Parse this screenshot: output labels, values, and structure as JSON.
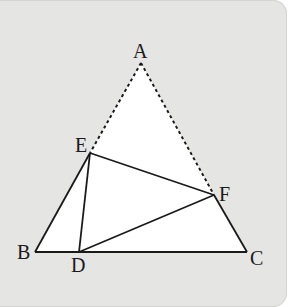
{
  "figure": {
    "type": "geometry-diagram",
    "colors": {
      "panel_bg": "#e5e5e3",
      "line": "#1a1a1a",
      "fill": "#ffffff"
    },
    "points": {
      "A": {
        "label": "A",
        "x": 141,
        "y": 63
      },
      "B": {
        "label": "B",
        "x": 35,
        "y": 252
      },
      "C": {
        "label": "C",
        "x": 247,
        "y": 252
      },
      "D": {
        "label": "D",
        "x": 79,
        "y": 252
      },
      "E": {
        "label": "E",
        "x": 90,
        "y": 153
      },
      "F": {
        "label": "F",
        "x": 214,
        "y": 195
      }
    },
    "solid_segments": [
      "BC",
      "BE",
      "CF",
      "EF",
      "ED",
      "DF"
    ],
    "dashed_segments": [
      "AE",
      "AF"
    ]
  }
}
